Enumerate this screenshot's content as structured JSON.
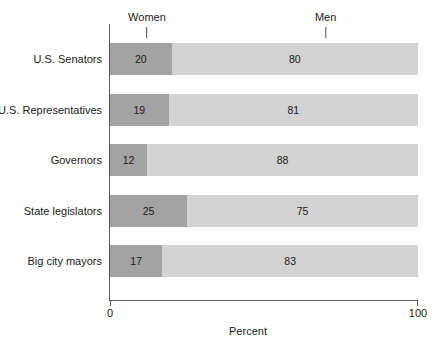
{
  "chart_data": {
    "type": "bar",
    "orientation": "horizontal",
    "stacked": true,
    "title": "",
    "xlabel": "Percent",
    "ylabel": "",
    "xlim": [
      0,
      100
    ],
    "grid": false,
    "legend_position": "top-inline-annotation",
    "categories": [
      "U.S. Senators",
      "U.S. Representatives",
      "Governors",
      "State legislators",
      "Big city mayors"
    ],
    "series": [
      {
        "name": "Women",
        "color": "#a3a3a3",
        "values": [
          20,
          19,
          12,
          25,
          17
        ]
      },
      {
        "name": "Men",
        "color": "#d3d3d3",
        "values": [
          80,
          81,
          88,
          75,
          83
        ]
      }
    ],
    "annotations": [
      {
        "text": "Women",
        "at_percent": 12
      },
      {
        "text": "Men",
        "at_percent": 70
      }
    ],
    "xticks": [
      {
        "value": 0,
        "label": "0"
      },
      {
        "value": 100,
        "label": "100"
      }
    ]
  }
}
